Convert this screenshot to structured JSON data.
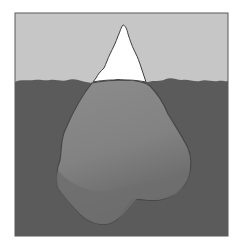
{
  "illustration": {
    "subject": "iceberg",
    "description": "Tip of an iceberg above the waterline with a much larger submerged mass below",
    "colors": {
      "background": "#ffffff",
      "sky": "#c6c6c6",
      "water": "#5b5b5b",
      "ice_above": "#ffffff",
      "ice_below_light": "#8a8a8a",
      "ice_below_dark": "#6c6c6c",
      "outline": "#3f3f3f"
    }
  }
}
